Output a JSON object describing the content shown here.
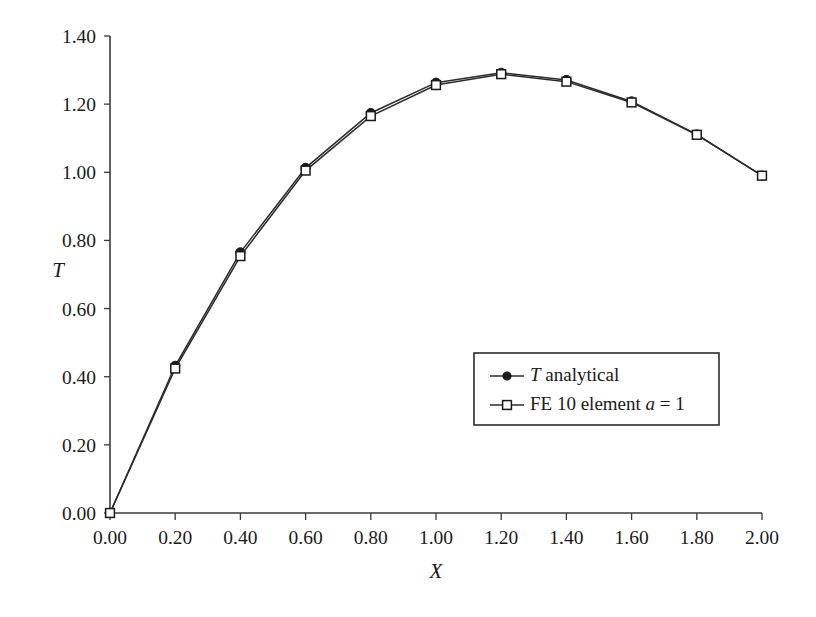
{
  "chart_data": {
    "type": "line",
    "title": "",
    "subtitle": "",
    "xlabel": "X",
    "ylabel": "T",
    "xlim": [
      0.0,
      2.0
    ],
    "ylim": [
      0.0,
      1.4
    ],
    "xticks": [
      "0.00",
      "0.20",
      "0.40",
      "0.60",
      "0.80",
      "1.00",
      "1.20",
      "1.40",
      "1.60",
      "1.80",
      "2.00"
    ],
    "yticks": [
      "0.00",
      "0.20",
      "0.40",
      "0.60",
      "0.80",
      "1.00",
      "1.20",
      "1.40"
    ],
    "xtick_values": [
      0.0,
      0.2,
      0.4,
      0.6,
      0.8,
      1.0,
      1.2,
      1.4,
      1.6,
      1.8,
      2.0
    ],
    "ytick_values": [
      0.0,
      0.2,
      0.4,
      0.6,
      0.8,
      1.0,
      1.2,
      1.4
    ],
    "grid": false,
    "legend_position": "center-right",
    "x": [
      0.0,
      0.2,
      0.4,
      0.6,
      0.8,
      1.0,
      1.2,
      1.4,
      1.6,
      1.8,
      2.0
    ],
    "series": [
      {
        "name": "T analytical",
        "name_italic_prefix": "T",
        "name_rest": " analytical",
        "marker": "filled-circle",
        "color": "#1a1a1a",
        "values": [
          0.0,
          0.432,
          0.765,
          1.013,
          1.174,
          1.263,
          1.292,
          1.271,
          1.208,
          1.111,
          0.99
        ]
      },
      {
        "name": "FE 10 element a = 1",
        "marker": "open-square",
        "color": "#1a1a1a",
        "values": [
          0.0,
          0.424,
          0.754,
          1.005,
          1.165,
          1.256,
          1.288,
          1.266,
          1.205,
          1.11,
          0.99
        ]
      }
    ]
  },
  "legend": {
    "entries": [
      {
        "italic": "T",
        "plain": " analytical",
        "marker": "filled-circle"
      },
      {
        "plain_before": "FE 10 element ",
        "italic": "a",
        "plain_after": " = 1",
        "marker": "open-square"
      }
    ]
  },
  "axes": {
    "x_title": "X",
    "y_title": "T"
  },
  "colors": {
    "line": "#2b2b2b",
    "axis": "#3a3a3a",
    "background": "#ffffff",
    "text": "#1a1a1a"
  }
}
